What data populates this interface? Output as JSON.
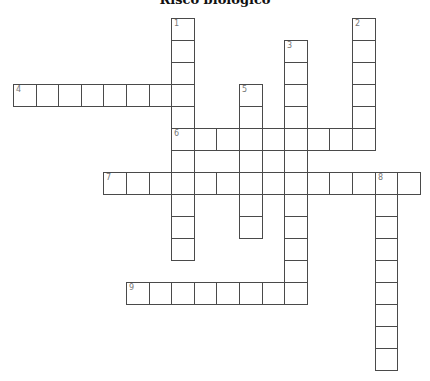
{
  "title": "Risco biológico",
  "grid": {
    "origin_x": 13,
    "origin_y": 18,
    "cell_w": 22.6,
    "cell_h": 22,
    "border_color": "#4a4a4a",
    "number_color": "#777777"
  },
  "entries": [
    {
      "number": "1",
      "direction": "down",
      "row": 0,
      "col": 7,
      "length": 11
    },
    {
      "number": "2",
      "direction": "down",
      "row": 0,
      "col": 15,
      "length": 6
    },
    {
      "number": "3",
      "direction": "down",
      "row": 1,
      "col": 12,
      "length": 12
    },
    {
      "number": "4",
      "direction": "across",
      "row": 3,
      "col": 0,
      "length": 8
    },
    {
      "number": "5",
      "direction": "down",
      "row": 3,
      "col": 10,
      "length": 7
    },
    {
      "number": "6",
      "direction": "across",
      "row": 5,
      "col": 7,
      "length": 9
    },
    {
      "number": "7",
      "direction": "across",
      "row": 7,
      "col": 4,
      "length": 14
    },
    {
      "number": "8",
      "direction": "down",
      "row": 7,
      "col": 16,
      "length": 9
    },
    {
      "number": "9",
      "direction": "across",
      "row": 12,
      "col": 5,
      "length": 8
    }
  ]
}
